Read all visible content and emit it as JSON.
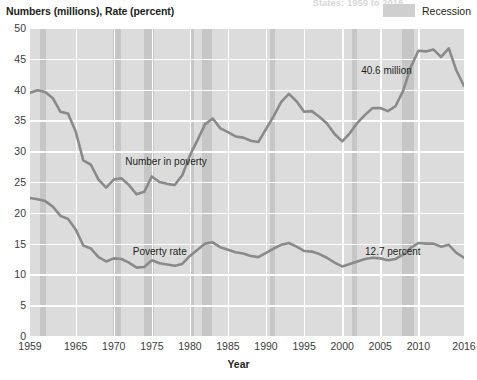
{
  "figure": {
    "cut_title": "States: 1959 to 2016",
    "y_axis_title": "Numbers (millions), Rate (percent)",
    "x_axis_title": "Year"
  },
  "legend": {
    "items": [
      {
        "label": "Recession",
        "color": "#c6c6c6",
        "swatch_name": "recession-swatch"
      }
    ]
  },
  "colors": {
    "plot_background": "#dcdcdc",
    "recession_band": "#c6c6c6",
    "gridline": "#ffffff",
    "series_line": "#8a8a8a",
    "text": "#231f20"
  },
  "chart_data": {
    "type": "line",
    "title": "",
    "xlabel": "Year",
    "ylabel": "Numbers (millions), Rate (percent)",
    "xlim": [
      1959,
      2016
    ],
    "ylim": [
      0,
      50
    ],
    "yticks": [
      0,
      5,
      10,
      15,
      20,
      25,
      30,
      35,
      40,
      45,
      50
    ],
    "xticks": [
      1959,
      1965,
      1970,
      1975,
      1980,
      1985,
      1990,
      1995,
      2000,
      2005,
      2010,
      2016
    ],
    "grid": true,
    "legend_position": "top-right",
    "x": [
      1959,
      1960,
      1961,
      1962,
      1963,
      1964,
      1965,
      1966,
      1967,
      1968,
      1969,
      1970,
      1971,
      1972,
      1973,
      1974,
      1975,
      1976,
      1977,
      1978,
      1979,
      1980,
      1981,
      1982,
      1983,
      1984,
      1985,
      1986,
      1987,
      1988,
      1989,
      1990,
      1991,
      1992,
      1993,
      1994,
      1995,
      1996,
      1997,
      1998,
      1999,
      2000,
      2001,
      2002,
      2003,
      2004,
      2005,
      2006,
      2007,
      2008,
      2009,
      2010,
      2011,
      2012,
      2013,
      2014,
      2015,
      2016
    ],
    "series": [
      {
        "name": "Number in poverty",
        "unit": "millions",
        "label_text": "Number in poverty",
        "end_label": "40.6 million",
        "values": [
          39.5,
          39.9,
          39.6,
          38.6,
          36.4,
          36.1,
          33.2,
          28.5,
          27.8,
          25.4,
          24.1,
          25.4,
          25.6,
          24.5,
          23.0,
          23.4,
          25.9,
          25.0,
          24.7,
          24.5,
          26.1,
          29.3,
          31.8,
          34.4,
          35.3,
          33.7,
          33.1,
          32.4,
          32.2,
          31.7,
          31.5,
          33.6,
          35.7,
          38.0,
          39.3,
          38.1,
          36.4,
          36.5,
          35.6,
          34.5,
          32.8,
          31.6,
          32.9,
          34.6,
          35.9,
          37.0,
          37.0,
          36.5,
          37.3,
          39.8,
          43.6,
          46.3,
          46.2,
          46.5,
          45.3,
          46.7,
          43.1,
          40.6
        ]
      },
      {
        "name": "Poverty rate",
        "unit": "percent",
        "label_text": "Poverty rate",
        "end_label": "12.7 percent",
        "values": [
          22.4,
          22.2,
          21.9,
          21.0,
          19.5,
          19.0,
          17.3,
          14.7,
          14.2,
          12.8,
          12.1,
          12.6,
          12.5,
          11.9,
          11.1,
          11.2,
          12.3,
          11.8,
          11.6,
          11.4,
          11.7,
          13.0,
          14.0,
          15.0,
          15.2,
          14.4,
          14.0,
          13.6,
          13.4,
          13.0,
          12.8,
          13.5,
          14.2,
          14.8,
          15.1,
          14.5,
          13.8,
          13.7,
          13.3,
          12.7,
          11.9,
          11.3,
          11.7,
          12.1,
          12.5,
          12.7,
          12.6,
          12.3,
          12.5,
          13.2,
          14.3,
          15.1,
          15.0,
          15.0,
          14.5,
          14.8,
          13.5,
          12.7
        ]
      }
    ],
    "recessions": [
      {
        "start": 1960.33,
        "end": 1961.08
      },
      {
        "start": 1969.92,
        "end": 1970.92
      },
      {
        "start": 1973.92,
        "end": 1975.25
      },
      {
        "start": 1980.08,
        "end": 1980.58
      },
      {
        "start": 1981.58,
        "end": 1982.92
      },
      {
        "start": 1990.58,
        "end": 1991.17
      },
      {
        "start": 2001.25,
        "end": 2001.92
      },
      {
        "start": 2007.92,
        "end": 2009.42
      }
    ],
    "annotations": [
      {
        "text": "Number in poverty",
        "x": 1971.5,
        "y": 28.2
      },
      {
        "text": "Poverty rate",
        "x": 1972.5,
        "y": 13.6
      },
      {
        "text": "40.6 million",
        "x": 2002.5,
        "y": 43.1
      },
      {
        "text": "12.7 percent",
        "x": 2003.0,
        "y": 13.7
      }
    ]
  }
}
